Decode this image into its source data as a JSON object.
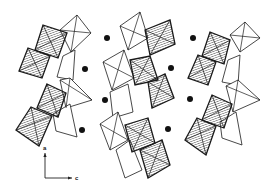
{
  "figure": {
    "colors": {
      "line": "#1a1a1a",
      "hatch": "#1a1a1a",
      "open_fill": "#ffffff",
      "dot": "#111111",
      "background": "#ffffff"
    },
    "chains": [
      {
        "name": "left-chain",
        "hatched": [
          [
            [
              43,
              25
            ],
            [
              67,
              33
            ],
            [
              58,
              58
            ],
            [
              35,
              50
            ]
          ],
          [
            [
              28,
              48
            ],
            [
              50,
              56
            ],
            [
              42,
              78
            ],
            [
              19,
              71
            ]
          ],
          [
            [
              47,
              84
            ],
            [
              66,
              93
            ],
            [
              58,
              117
            ],
            [
              37,
              108
            ]
          ],
          [
            [
              31,
              107
            ],
            [
              52,
              116
            ],
            [
              39,
              146
            ],
            [
              16,
              130
            ]
          ]
        ],
        "open": [
          [
            [
              60,
              30
            ],
            [
              77,
              15
            ],
            [
              91,
              33
            ],
            [
              71,
              52
            ]
          ],
          [
            [
              63,
              56
            ],
            [
              75,
              50
            ],
            [
              73,
              80
            ],
            [
              57,
              77
            ]
          ],
          [
            [
              60,
              80
            ],
            [
              70,
              78
            ],
            [
              92,
              100
            ],
            [
              66,
              108
            ]
          ],
          [
            [
              53,
              114
            ],
            [
              70,
              104
            ],
            [
              77,
              137
            ],
            [
              56,
              131
            ]
          ]
        ],
        "inner_lines": [
          [
            [
              43,
              25
            ],
            [
              58,
              58
            ]
          ],
          [
            [
              67,
              33
            ],
            [
              35,
              50
            ]
          ],
          [
            [
              28,
              48
            ],
            [
              42,
              78
            ]
          ],
          [
            [
              50,
              56
            ],
            [
              19,
              71
            ]
          ],
          [
            [
              47,
              84
            ],
            [
              58,
              117
            ]
          ],
          [
            [
              66,
              93
            ],
            [
              37,
              108
            ]
          ],
          [
            [
              31,
              107
            ],
            [
              39,
              146
            ]
          ],
          [
            [
              52,
              116
            ],
            [
              16,
              130
            ]
          ],
          [
            [
              77,
              15
            ],
            [
              71,
              52
            ]
          ],
          [
            [
              60,
              30
            ],
            [
              91,
              33
            ]
          ],
          [
            [
              70,
              78
            ],
            [
              66,
              108
            ]
          ],
          [
            [
              60,
              80
            ],
            [
              92,
              100
            ]
          ]
        ]
      },
      {
        "name": "center-chain",
        "hatched": [
          [
            [
              145,
              30
            ],
            [
              170,
              20
            ],
            [
              175,
              44
            ],
            [
              150,
              55
            ]
          ],
          [
            [
              130,
              60
            ],
            [
              150,
              56
            ],
            [
              158,
              80
            ],
            [
              135,
              85
            ]
          ],
          [
            [
              148,
              82
            ],
            [
              165,
              74
            ],
            [
              174,
              98
            ],
            [
              152,
              108
            ]
          ],
          [
            [
              125,
              125
            ],
            [
              148,
              118
            ],
            [
              155,
              143
            ],
            [
              132,
              152
            ]
          ],
          [
            [
              140,
              150
            ],
            [
              162,
              140
            ],
            [
              170,
              165
            ],
            [
              148,
              178
            ]
          ]
        ],
        "open": [
          [
            [
              120,
              26
            ],
            [
              140,
              12
            ],
            [
              148,
              38
            ],
            [
              128,
              50
            ]
          ],
          [
            [
              103,
              62
            ],
            [
              124,
              50
            ],
            [
              134,
              78
            ],
            [
              112,
              90
            ]
          ],
          [
            [
              110,
              92
            ],
            [
              128,
              84
            ],
            [
              133,
              112
            ],
            [
              113,
              118
            ]
          ],
          [
            [
              100,
              124
            ],
            [
              118,
              112
            ],
            [
              128,
              140
            ],
            [
              110,
              150
            ]
          ],
          [
            [
              116,
              150
            ],
            [
              130,
              140
            ],
            [
              142,
              170
            ],
            [
              125,
              178
            ]
          ]
        ],
        "inner_lines": [
          [
            [
              145,
              30
            ],
            [
              175,
              44
            ]
          ],
          [
            [
              170,
              20
            ],
            [
              150,
              55
            ]
          ],
          [
            [
              130,
              60
            ],
            [
              158,
              80
            ]
          ],
          [
            [
              150,
              56
            ],
            [
              135,
              85
            ]
          ],
          [
            [
              148,
              82
            ],
            [
              174,
              98
            ]
          ],
          [
            [
              165,
              74
            ],
            [
              152,
              108
            ]
          ],
          [
            [
              125,
              125
            ],
            [
              155,
              143
            ]
          ],
          [
            [
              148,
              118
            ],
            [
              132,
              152
            ]
          ],
          [
            [
              140,
              150
            ],
            [
              170,
              165
            ]
          ],
          [
            [
              162,
              140
            ],
            [
              148,
              178
            ]
          ],
          [
            [
              120,
              26
            ],
            [
              148,
              38
            ]
          ],
          [
            [
              140,
              12
            ],
            [
              128,
              50
            ]
          ],
          [
            [
              103,
              62
            ],
            [
              134,
              78
            ]
          ],
          [
            [
              124,
              50
            ],
            [
              112,
              90
            ]
          ],
          [
            [
              100,
              124
            ],
            [
              128,
              140
            ]
          ],
          [
            [
              118,
              112
            ],
            [
              110,
              150
            ]
          ]
        ]
      },
      {
        "name": "right-chain",
        "hatched": [
          [
            [
              210,
              32
            ],
            [
              230,
              40
            ],
            [
              224,
              64
            ],
            [
              202,
              56
            ]
          ],
          [
            [
              198,
              55
            ],
            [
              216,
              62
            ],
            [
              208,
              85
            ],
            [
              188,
              78
            ]
          ],
          [
            [
              212,
              95
            ],
            [
              232,
              104
            ],
            [
              224,
              128
            ],
            [
              202,
              120
            ]
          ],
          [
            [
              197,
              118
            ],
            [
              216,
              126
            ],
            [
              206,
              155
            ],
            [
              185,
              140
            ]
          ]
        ],
        "open": [
          [
            [
              230,
              35
            ],
            [
              245,
              22
            ],
            [
              260,
              38
            ],
            [
              240,
              52
            ]
          ],
          [
            [
              228,
              60
            ],
            [
              240,
              55
            ],
            [
              238,
              85
            ],
            [
              222,
              82
            ]
          ],
          [
            [
              226,
              86
            ],
            [
              238,
              80
            ],
            [
              260,
              100
            ],
            [
              233,
              112
            ]
          ],
          [
            [
              220,
              122
            ],
            [
              236,
              112
            ],
            [
              242,
              145
            ],
            [
              222,
              138
            ]
          ]
        ],
        "inner_lines": [
          [
            [
              210,
              32
            ],
            [
              224,
              64
            ]
          ],
          [
            [
              230,
              40
            ],
            [
              202,
              56
            ]
          ],
          [
            [
              198,
              55
            ],
            [
              208,
              85
            ]
          ],
          [
            [
              216,
              62
            ],
            [
              188,
              78
            ]
          ],
          [
            [
              212,
              95
            ],
            [
              224,
              128
            ]
          ],
          [
            [
              232,
              104
            ],
            [
              202,
              120
            ]
          ],
          [
            [
              197,
              118
            ],
            [
              206,
              155
            ]
          ],
          [
            [
              216,
              126
            ],
            [
              185,
              140
            ]
          ],
          [
            [
              245,
              22
            ],
            [
              240,
              52
            ]
          ],
          [
            [
              230,
              35
            ],
            [
              260,
              38
            ]
          ],
          [
            [
              238,
              80
            ],
            [
              233,
              112
            ]
          ],
          [
            [
              226,
              86
            ],
            [
              260,
              100
            ]
          ]
        ]
      }
    ],
    "cations": [
      [
        107,
        38
      ],
      [
        85,
        69
      ],
      [
        105,
        100
      ],
      [
        82,
        130
      ],
      [
        193,
        38
      ],
      [
        171,
        68
      ],
      [
        190,
        99
      ],
      [
        168,
        129
      ]
    ],
    "axes": {
      "origin": [
        45,
        178
      ],
      "a_end": [
        45,
        153
      ],
      "c_end": [
        72,
        178
      ],
      "a_label": "a",
      "c_label": "c"
    }
  }
}
